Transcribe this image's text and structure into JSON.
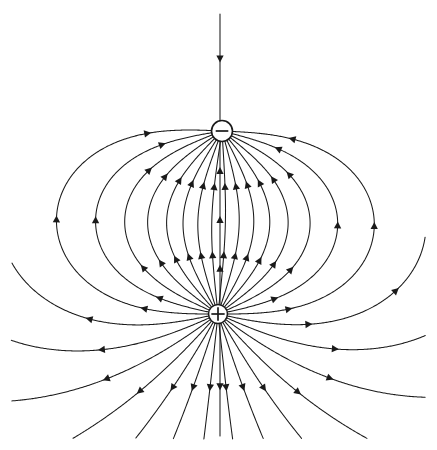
{
  "figure": {
    "type": "vector-field-diagram",
    "background_color": "#ffffff",
    "line_color": "#1a1a1a",
    "canvas": {
      "width": 437,
      "height": 450
    }
  },
  "charges": [
    {
      "id": "negative-charge",
      "label": "−",
      "sign": "negative",
      "symbol_name": "minus-sign",
      "cx": 222,
      "cy": 131,
      "r": 10.5,
      "fill": "#ffffff",
      "stroke": "#1a1a1a"
    },
    {
      "id": "positive-charge",
      "label": "+",
      "sign": "positive",
      "symbol_name": "plus-sign",
      "cx": 218,
      "cy": 314,
      "r": 9.5,
      "fill": "#ffffff",
      "stroke": "#1a1a1a"
    }
  ],
  "field": {
    "direction": "from positive charge to negative charge",
    "arrow_style": "solid-triangle",
    "arrow_size": 7,
    "line_width": 1.05,
    "line_count": 30,
    "closed_loop_count": 20,
    "open_line_count": 10,
    "axis_line": {
      "name": "vertical-axis-field-line",
      "x": 220,
      "top_y": 14,
      "bottom_y": 436,
      "description": "straight vertical line through both charges"
    },
    "extents": {
      "left_outer_x": 17,
      "right_outer_x": 420,
      "top_y": 14,
      "bottom_y": 436,
      "mid_y": 225
    }
  },
  "chart_data": {
    "type": "scatter",
    "xlabel": "",
    "ylabel": "",
    "xlim": [
      0,
      437
    ],
    "ylim": [
      450,
      0
    ],
    "grid": false,
    "legend": null,
    "series": [
      {
        "name": "negative charge",
        "x": [
          222
        ],
        "y": [
          131
        ],
        "annotation": "−"
      },
      {
        "name": "positive charge",
        "x": [
          218
        ],
        "y": [
          314
        ],
        "annotation": "+"
      }
    ],
    "annotations": [
      "Field lines originate on the positive charge and terminate on the negative charge.",
      "Arrowheads point from + toward − along every line.",
      "Inner lines run straight up the dipole axis; outer lines form closed loops."
    ]
  }
}
